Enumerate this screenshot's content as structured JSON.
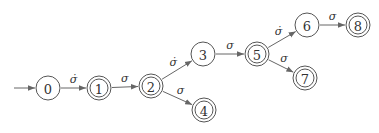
{
  "diagram": {
    "type": "finite-automaton",
    "initial_state": "0",
    "nodes": [
      {
        "id": "0",
        "label": "0",
        "x": 48,
        "y": 88,
        "accepting": false
      },
      {
        "id": "1",
        "label": "1",
        "x": 99,
        "y": 88,
        "accepting": true
      },
      {
        "id": "2",
        "label": "2",
        "x": 151,
        "y": 86,
        "accepting": true
      },
      {
        "id": "3",
        "label": "3",
        "x": 203,
        "y": 54,
        "accepting": false
      },
      {
        "id": "4",
        "label": "4",
        "x": 204,
        "y": 110,
        "accepting": true
      },
      {
        "id": "5",
        "label": "5",
        "x": 257,
        "y": 54,
        "accepting": true
      },
      {
        "id": "6",
        "label": "6",
        "x": 307,
        "y": 25,
        "accepting": false
      },
      {
        "id": "7",
        "label": "7",
        "x": 305,
        "y": 78,
        "accepting": true
      },
      {
        "id": "8",
        "label": "8",
        "x": 358,
        "y": 25,
        "accepting": true
      }
    ],
    "edges": [
      {
        "from": "0",
        "to": "1",
        "label": "σ̇"
      },
      {
        "from": "1",
        "to": "2",
        "label": "σ"
      },
      {
        "from": "2",
        "to": "3",
        "label": "σ̇"
      },
      {
        "from": "2",
        "to": "4",
        "label": "σ"
      },
      {
        "from": "3",
        "to": "5",
        "label": "σ"
      },
      {
        "from": "5",
        "to": "6",
        "label": "σ̇"
      },
      {
        "from": "5",
        "to": "7",
        "label": "σ"
      },
      {
        "from": "6",
        "to": "8",
        "label": "σ"
      }
    ],
    "colors": {
      "stroke": "#555555",
      "edge": "#666666",
      "text": "#333333"
    }
  }
}
